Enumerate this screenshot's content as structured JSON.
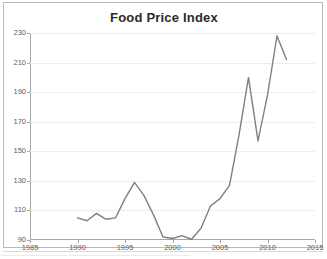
{
  "chart_data": {
    "type": "line",
    "title": "Food Price Index",
    "xlabel": "",
    "ylabel": "",
    "xlim": [
      1985,
      2015
    ],
    "ylim": [
      90,
      230
    ],
    "xticks": [
      1985,
      1990,
      1995,
      2000,
      2005,
      2010,
      2015
    ],
    "yticks": [
      90,
      110,
      130,
      150,
      170,
      190,
      210,
      230
    ],
    "grid": "horizontal",
    "legend": "none",
    "line_color": "#808080",
    "series": [
      {
        "name": "Food Price Index",
        "x": [
          1990,
          1991,
          1992,
          1993,
          1994,
          1995,
          1996,
          1997,
          1998,
          1999,
          2000,
          2001,
          2002,
          2003,
          2004,
          2005,
          2006,
          2007,
          2008,
          2009,
          2010,
          2011,
          2012
        ],
        "values": [
          105,
          103,
          108,
          104,
          105,
          118,
          129,
          120,
          107,
          92,
          91,
          93,
          90.5,
          98,
          113,
          118,
          127,
          161,
          200,
          157,
          188,
          228,
          212
        ]
      }
    ]
  },
  "chart": {
    "title": "Food Price Index",
    "y_axis_labels": [
      "230",
      "210",
      "190",
      "170",
      "150",
      "130",
      "110",
      "90"
    ],
    "x_axis_labels": [
      "1985",
      "1990",
      "1995",
      "2000",
      "2005",
      "2010",
      "2015"
    ]
  }
}
